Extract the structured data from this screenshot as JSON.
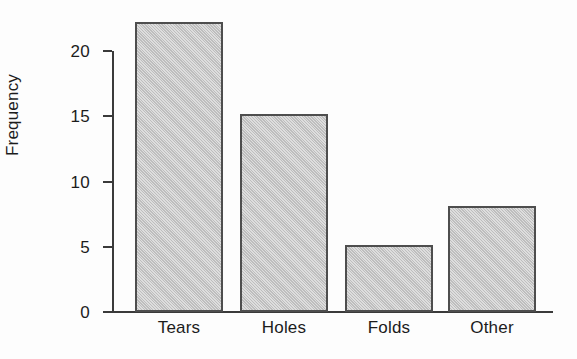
{
  "chart_data": {
    "type": "bar",
    "title": "",
    "xlabel": "",
    "ylabel": "Frequency",
    "categories": [
      "Tears",
      "Holes",
      "Folds",
      "Other"
    ],
    "values": [
      22.2,
      15.2,
      5.1,
      8.1
    ],
    "ylim": [
      0,
      22.5
    ],
    "yticks": [
      0,
      5,
      10,
      15,
      20
    ],
    "ytick_labels": [
      "0",
      "5",
      "10",
      "15",
      "20"
    ],
    "grid": false,
    "legend": false,
    "bar_fill_color": "#c9c9c9",
    "bar_edge_color": "#4e4e4e",
    "axis_color": "#3a3a3a",
    "background_color": "#fdfdfd",
    "text_color": "#1c1c1c"
  }
}
